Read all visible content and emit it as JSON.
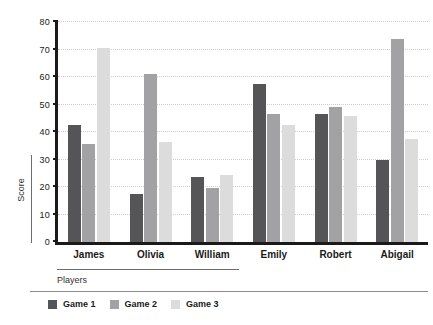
{
  "chart_data": {
    "type": "bar",
    "title": "",
    "xlabel": "Players",
    "ylabel": "Score",
    "categories": [
      "James",
      "Olivia",
      "William",
      "Emily",
      "Robert",
      "Abigail"
    ],
    "series": [
      {
        "name": "Game 1",
        "color": "#555557",
        "values": [
          42.5,
          17.5,
          23.5,
          57.5,
          46.5,
          30.0
        ]
      },
      {
        "name": "Game 2",
        "color": "#a2a2a4",
        "values": [
          35.5,
          61.0,
          19.5,
          46.5,
          49.0,
          74.0
        ]
      },
      {
        "name": "Game 3",
        "color": "#dcdcdc",
        "values": [
          70.5,
          36.5,
          24.5,
          42.5,
          46.0,
          37.5
        ]
      }
    ],
    "ylim": [
      0,
      80
    ],
    "yticks": [
      0,
      10,
      20,
      30,
      40,
      50,
      60,
      70,
      80
    ],
    "ytick_labels": [
      "0",
      "10",
      "20",
      "30",
      "40",
      "50",
      "60",
      "70",
      "80"
    ],
    "grid": true,
    "grid_style": "dotted",
    "legend_position": "bottom-left",
    "background": "#ffffff",
    "axis_color": "#1a1a1a"
  }
}
